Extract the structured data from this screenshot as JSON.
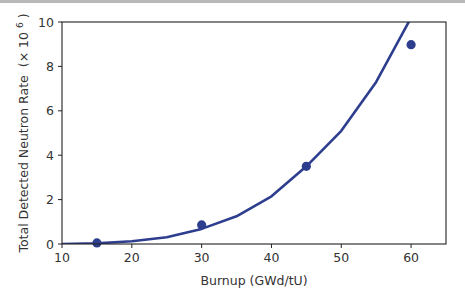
{
  "chart_data": {
    "type": "line",
    "title": "",
    "xlabel": "Burnup (GWd/tU)",
    "ylabel": "Total Detected Neutron Rate",
    "ylabel_unit_prefix": "(× 10",
    "ylabel_unit_exp": "6",
    "ylabel_unit_suffix": ")",
    "xlim": [
      10,
      65
    ],
    "ylim": [
      0,
      10
    ],
    "xticks": [
      10,
      20,
      30,
      40,
      50,
      60
    ],
    "yticks": [
      0,
      2,
      4,
      6,
      8,
      10
    ],
    "grid": false,
    "legend": null,
    "colors": {
      "series": "#2e3e8e",
      "axis": "#222222"
    },
    "series": [
      {
        "name": "model",
        "kind": "line",
        "x": [
          10,
          15,
          20,
          25,
          30,
          35,
          40,
          45,
          50,
          55,
          60
        ],
        "y": [
          0.0,
          0.03,
          0.12,
          0.3,
          0.68,
          1.25,
          2.15,
          3.5,
          5.1,
          7.3,
          10.2
        ]
      },
      {
        "name": "measured",
        "kind": "scatter",
        "x": [
          15,
          30,
          45,
          60
        ],
        "y": [
          0.05,
          0.86,
          3.5,
          8.98
        ]
      }
    ]
  }
}
